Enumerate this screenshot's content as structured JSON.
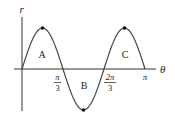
{
  "chart_data": {
    "type": "line",
    "title": "",
    "function": "r = sin(3θ)",
    "xlabel": "θ",
    "ylabel": "r",
    "xlim": [
      0,
      3.14159
    ],
    "ylim": [
      -1,
      1
    ],
    "grid": false,
    "x_ticks": [
      {
        "value": 1.0472,
        "label_num": "π",
        "label_den": "3"
      },
      {
        "value": 2.0944,
        "label_num": "2π",
        "label_den": "3"
      },
      {
        "value": 3.14159,
        "label": "π"
      }
    ],
    "x": [
      0,
      0.5236,
      1.0472,
      1.5708,
      2.0944,
      2.618,
      3.14159
    ],
    "y": [
      0,
      1,
      0,
      -1,
      0,
      1,
      0
    ],
    "marked_points": [
      {
        "x": 0.5236,
        "y": 1
      },
      {
        "x": 1.5708,
        "y": -1
      },
      {
        "x": 2.618,
        "y": 1
      }
    ],
    "annotations": [
      {
        "text": "A",
        "x": 0.5236,
        "y": 0.35
      },
      {
        "text": "B",
        "x": 1.5708,
        "y": -0.4
      },
      {
        "text": "C",
        "x": 2.618,
        "y": 0.35
      }
    ]
  },
  "labels": {
    "y_axis": "r",
    "x_axis": "θ",
    "tick1_num": "π",
    "tick1_den": "3",
    "tick2_num": "2π",
    "tick2_den": "3",
    "tick3": "π",
    "region_a": "A",
    "region_b": "B",
    "region_c": "C"
  },
  "colors": {
    "curve": "#444444",
    "axis": "#333333",
    "point": "#111111"
  }
}
